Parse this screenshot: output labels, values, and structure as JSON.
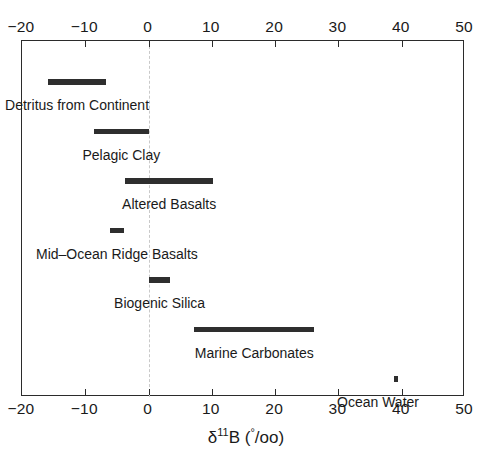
{
  "chart_data": {
    "type": "bar",
    "orientation": "horizontal-range",
    "title": "",
    "xlabel": "δ¹¹B (°/oo)",
    "xlabel_parts": {
      "delta": "δ",
      "mass": "11",
      "element": "B",
      "unit_open": " (",
      "unit_deg": "°",
      "unit_rest": "/oo",
      "unit_close": ")"
    },
    "ylabel": "",
    "xlim": [
      -20,
      50
    ],
    "ylim": [
      0,
      7
    ],
    "grid": false,
    "legend": false,
    "zero_reference_line": 0,
    "axis_ticks_top": true,
    "axis_ticks_bottom": true,
    "xticks": [
      -20,
      -10,
      0,
      10,
      20,
      30,
      40,
      50
    ],
    "xtick_labels": [
      "−20",
      "−10",
      "0",
      "10",
      "20",
      "30",
      "40",
      "50"
    ],
    "bar_color": "#2e2e2e",
    "frame_color": "#2b2b2b",
    "zero_line_color": "#c9c9c9",
    "categories": [
      "Detritus from Continent",
      "Pelagic Clay",
      "Altered Basalts",
      "Mid–Ocean Ridge Basalts",
      "Biogenic Silica",
      "Marine Carbonates",
      "Ocean Water"
    ],
    "ranges": [
      {
        "label": "Detritus from Continent",
        "min": -15.9,
        "max": -6.7,
        "row": 0
      },
      {
        "label": "Pelagic Clay",
        "min": -8.6,
        "max": 0.0,
        "row": 1
      },
      {
        "label": "Altered Basalts",
        "min": -3.7,
        "max": 10.2,
        "row": 2
      },
      {
        "label": "Mid–Ocean Ridge Basalts",
        "min": -6.1,
        "max": -3.9,
        "row": 3
      },
      {
        "label": "Biogenic Silica",
        "min": 0.1,
        "max": 3.4,
        "row": 4
      },
      {
        "label": "Marine Carbonates",
        "min": 7.2,
        "max": 26.2,
        "row": 5
      },
      {
        "label": "Ocean Water",
        "min": 38.8,
        "max": 39.4,
        "row": 6
      }
    ]
  }
}
